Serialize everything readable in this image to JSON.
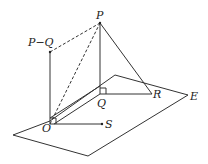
{
  "diagram": {
    "labels": {
      "P": "P",
      "PminusQ": "P−Q",
      "Q": "Q",
      "R": "R",
      "O": "O",
      "S": "S",
      "E": "E"
    }
  }
}
